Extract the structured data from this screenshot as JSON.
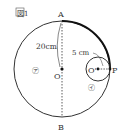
{
  "figure": {
    "title": "図1",
    "points": {
      "A": "A",
      "B": "B",
      "O": "O",
      "O_prime": "O'",
      "P": "P"
    },
    "measurements": {
      "big_radius": "20cm",
      "small_radius": "5 cm"
    },
    "regions": {
      "a": "㋐",
      "i": "㋑"
    },
    "colors": {
      "line": "#333333",
      "thick_arc": "#111111"
    }
  }
}
